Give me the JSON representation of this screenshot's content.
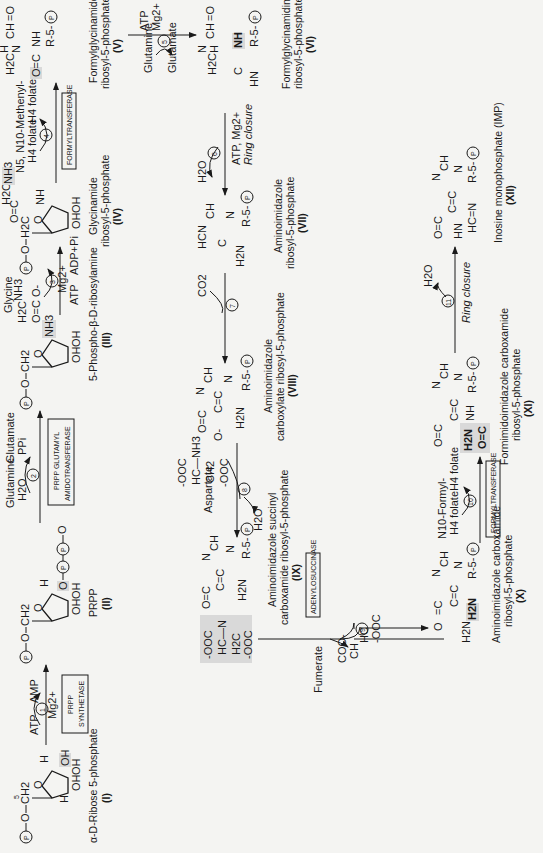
{
  "diagram": {
    "title_orientation": "rotated 90 degrees counter-clockwise",
    "compounds": [
      {
        "id": "I",
        "name": "α-D-Ribose 5-phosphate",
        "numeral": "(I)"
      },
      {
        "id": "II",
        "name": "PRPP",
        "numeral": "(II)"
      },
      {
        "id": "III",
        "name": "5-Phospho-β-D-ribosylamine",
        "numeral": "(III)"
      },
      {
        "id": "IV",
        "name_line1": "Glycinamide",
        "name_line2": "ribosyl-5-phosphate",
        "numeral": "(IV)"
      },
      {
        "id": "V",
        "name_line1": "Formylglycinamide",
        "name_line2": "ribosyl-5-phosphate",
        "numeral": "(V)"
      },
      {
        "id": "VI",
        "name_line1": "Formylglycinamidine",
        "name_line2": "ribosyl-5-phosphate",
        "numeral": "(VI)"
      },
      {
        "id": "VII",
        "name_line1": "Aminoimidazole",
        "name_line2": "ribosyl-5-phosphate",
        "numeral": "(VII)"
      },
      {
        "id": "VIII",
        "name_line1": "Aminoimidazole",
        "name_line2": "carboxylate ribosyl-5-phosphate",
        "numeral": "(VIII)"
      },
      {
        "id": "IX",
        "name_line1": "Aminoimidazole succinyl",
        "name_line2": "carboxamide ribosyl-5-phosphate",
        "numeral": "(IX)"
      },
      {
        "id": "X",
        "name_line1": "Aminoimidazole carboxamide",
        "name_line2": "ribosyl-5-phosphate",
        "numeral": "(X)"
      },
      {
        "id": "XI",
        "name_line1": "Formimidoimidazole carboxamide",
        "name_line2": "ribosyl-5-phosphate",
        "numeral": "(XI)"
      },
      {
        "id": "XII",
        "name": "Inosine monophosphate (IMP)",
        "numeral": "(XII)"
      }
    ],
    "steps": [
      {
        "num": "1",
        "enzyme_line1": "PRPP",
        "enzyme_line2": "SYNTHETASE",
        "in": "ATP",
        "out": "AMP",
        "cofactor": "Mg2+"
      },
      {
        "num": "2",
        "enzyme_line1": "PRPP GLUTAMYL",
        "enzyme_line2": "AMIDOTRANSFERASE",
        "in1": "Glutamine",
        "in2": "H2O",
        "out1": "Glutamate",
        "out2": "PPi"
      },
      {
        "num": "3",
        "in_mol": "Glycine",
        "in": "ATP",
        "out": "ADP+Pi",
        "cofactor": "Mg2+"
      },
      {
        "num": "4",
        "enzyme": "FORMYLTRANSFERASE",
        "in_line1": "N5, N10-Methenyl-",
        "in_line2": "H4 folate",
        "out": "H4 folate"
      },
      {
        "num": "5",
        "in": "Glutamine",
        "out": "Glutamate",
        "cofactor_line1": "ATP",
        "cofactor_line2": "Mg2+"
      },
      {
        "num": "6",
        "out": "H2O",
        "cofactor": "ATP, Mg2+",
        "note": "Ring closure"
      },
      {
        "num": "7",
        "in": "CO2"
      },
      {
        "num": "8",
        "in_mol": "Aspartate",
        "out": "H2O"
      },
      {
        "num": "9",
        "out": "Fumerate",
        "enzyme": "ADENYLOSUCCINASE"
      },
      {
        "num": "10",
        "enzyme": "FORMYLTRANSFERASE",
        "in_line1": "N10-Formyl-",
        "in_line2": "H4 folate",
        "out": "H4 folate"
      },
      {
        "num": "11",
        "out": "H2O",
        "note": "Ring closure"
      }
    ],
    "atoms": {
      "P": "P",
      "R5P": "R-5-",
      "O": "O",
      "NH": "NH",
      "N": "N",
      "H": "H",
      "OH": "OH",
      "CH": "CH",
      "CH2": "CH2",
      "H2C": "H2C",
      "C": "C",
      "HC": "HC",
      "HN": "HN",
      "H2N": "H2N",
      "NH3": "NH3",
      "OOC": "-OOC",
      "COO": "COO-",
      "O_minus": "O-"
    },
    "colors": {
      "highlight": "#d9d9d9",
      "ink": "#1a1a1a",
      "paper": "#f4f4f2"
    }
  }
}
